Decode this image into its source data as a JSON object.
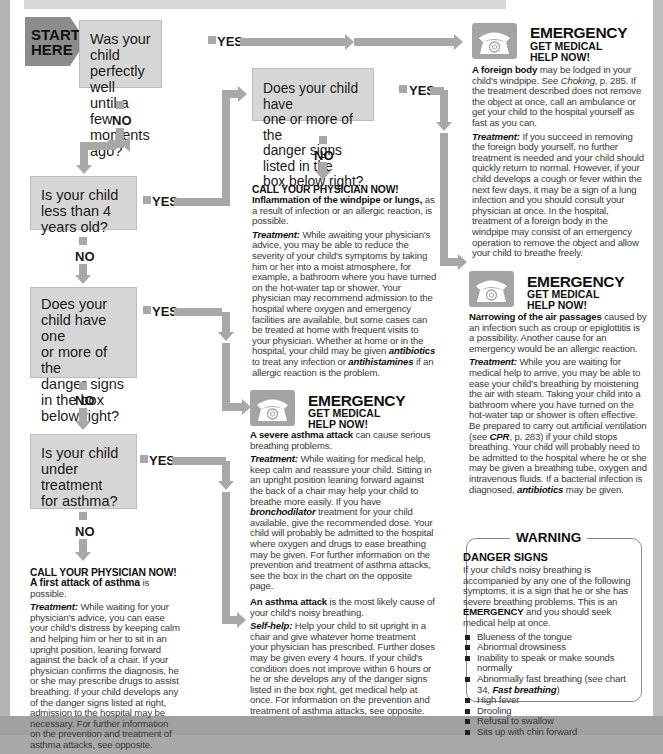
{
  "start": {
    "label_line1": "START",
    "label_line2": "HERE"
  },
  "questions": [
    {
      "id": "q1",
      "lines": [
        "Was your child",
        "perfectly well",
        "until a few",
        "moments ago?"
      ]
    },
    {
      "id": "q2",
      "lines": [
        "Does your child have",
        "one or more of the",
        "danger signs listed in the",
        "box below right?"
      ]
    },
    {
      "id": "q3",
      "lines": [
        "Is your child",
        "less than 4",
        "years old?"
      ]
    },
    {
      "id": "q4",
      "lines": [
        "Does your",
        "child have one",
        "or more of the",
        "danger signs",
        "in the box",
        "below right?"
      ]
    },
    {
      "id": "q5",
      "lines": [
        "Is your child",
        "under treatment",
        "for asthma?"
      ]
    }
  ],
  "labels": {
    "yes": "YES",
    "no": "NO"
  },
  "emergency": {
    "title": "EMERGENCY",
    "sub1": "GET MEDICAL",
    "sub2": "HELP NOW!"
  },
  "outcomes": {
    "foreign_body": {
      "lead_bold": "A foreign body",
      "lead_rest": " may be lodged in your child's windpipe. See ",
      "ref_italic": "Choking",
      "ref_rest": ", p. 285. If the treatment described does not remove the object at once, call an ambulance or get your child to the hospital yourself as fast as you can.",
      "treatment_label": "Treatment:",
      "treatment": " If you succeed in removing the foreign body yourself, no further treatment is needed and your child should quickly return to normal. However, if your child develops a cough or fever within the next few days, it may be a sign of a lung infection and you should consult your physician at once. In the hospital, treatment of a foreign body in the windpipe may consist of an emergency operation to remove the object and allow your child to breathe freely."
    },
    "inflammation": {
      "heading": "CALL YOUR PHYSICIAN NOW!",
      "lead_bold": "Inflammation of the windpipe or lungs,",
      "lead_rest": " as a result of infection or an allergic reaction, is possible.",
      "treatment_label": "Treatment:",
      "treatment_a": " While awaiting your physician's advice, you may be able to reduce the severity of your child's symptoms by taking him or her into a moist atmosphere, for example, a bathroom where you have turned on the hot-water tap or shower. Your physician may recommend admission to the hospital where oxygen and emergency facilities are available, but some cases can be treated at home with frequent visits to your physician. Whether at home or in the hospital, your child may be given ",
      "drug1": "antibiotics",
      "treatment_b": " to treat any infection or ",
      "drug2": "antihistamines",
      "treatment_c": " if an allergic reaction is the problem."
    },
    "narrowing": {
      "lead_bold": "Narrowing of the air passages",
      "lead_rest": " caused by an infection such as croup or epiglottitis is a possibility. Another cause for an emergency would be an allergic reaction.",
      "treatment_label": "Treatment:",
      "treatment_a": " While you are waiting for medical help to arrive, you may be able to ease your child's breathing by moistening the air with steam. Taking your child into a bathroom where you have turned on the hot-water tap or shower is often effective. Be prepared to carry out artificial ventilation (see ",
      "ref": "CPR",
      "treatment_b": ", p. 283) if your child stops breathing. Your child will probably need to be admitted to the hospital where he or she may be given a breathing tube, oxygen and intravenous fluids. If a bacterial infection is diagnosed, ",
      "drug": "antibiotics",
      "treatment_c": " may be given."
    },
    "severe_asthma": {
      "lead_bold": "A severe asthma attack",
      "lead_rest": " can cause serious breathing problems.",
      "treatment_label": "Treatment:",
      "treatment_a": " While waiting for medical help, keep calm and reassure your child. Sitting in an upright position leaning forward against the back of a chair may help your child to breathe more easily. If you have ",
      "drug": "bronchodilator",
      "treatment_b": " treatment for your child available, give the recommended dose. Your child will probably be admitted to the hospital where oxygen and drugs to ease breathing may be given. For further information on the prevention and treatment of asthma attacks, see the box in the chart on the opposite page."
    },
    "asthma_attack": {
      "lead_bold": "An asthma attack",
      "lead_rest": " is the most likely cause of your child's noisy breathing.",
      "selfhelp_label": "Self-help:",
      "selfhelp": " Help your child to sit upright in a chair and give whatever home treatment your physician has prescribed. Further doses may be given every 4 hours. If your child's condition does not improve within 6 hours or he or she develops any of the danger signs listed in the box right, get medical help at once. For information on the prevention and treatment of asthma attacks, see opposite."
    },
    "first_asthma": {
      "heading": "CALL YOUR PHYSICIAN NOW!",
      "lead_bold": "A first attack of asthma",
      "lead_rest": " is possible.",
      "treatment_label": "Treatment:",
      "treatment": " While waiting for your physician's advice, you can ease your child's distress by keeping calm and helping him or her to sit in an upright position, leaning forward against the back of a chair. If your physician confirms the diagnosis, he or she may prescribe drugs to assist breathing. If your child develops any of the danger signs listed at right, admission to the hospital may be necessary. For further information on the prevention and treatment of asthma attacks, see opposite."
    }
  },
  "warning": {
    "title": "WARNING",
    "subtitle": "DANGER SIGNS",
    "intro_a": "If your child's noisy breathing is accompanied by any one of the following symptoms, it is a sign that he or she has severe breathing problems. This is an ",
    "intro_bold": "EMERGENCY",
    "intro_b": " and you should seek medical help at once.",
    "signs": [
      "Blueness of the tongue",
      "Abnormal drowsiness",
      "Inability to speak or make sounds normally",
      "Abnormally fast breathing (see chart 34, ",
      "High fever",
      "Drooling",
      "Refusal to swallow",
      "Sits up with chin forward"
    ],
    "sign4_ref": "Fast breathing",
    "sign4_end": ")"
  },
  "colors": {
    "box_fill": "#d6d6d6",
    "arrow": "#a8a8a8",
    "start": "#8c8c8c",
    "page_bg": "#ffffff",
    "margin": "#a8a8a8"
  }
}
